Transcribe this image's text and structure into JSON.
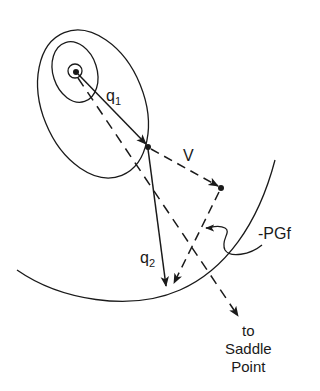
{
  "diagram": {
    "labels": {
      "q1": {
        "base": "q",
        "sub": "1"
      },
      "q2": {
        "base": "q",
        "sub": "2"
      },
      "v": "V",
      "pgf": "-PGf",
      "saddle_line1": "to",
      "saddle_line2": "Saddle",
      "saddle_line3": "Point"
    },
    "colors": {
      "ink": "#1a1a1a",
      "background": "#ffffff"
    }
  }
}
